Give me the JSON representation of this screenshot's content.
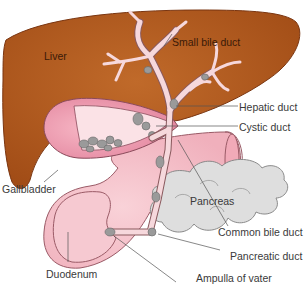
{
  "figure": {
    "colors": {
      "liver": "#b55a1e",
      "liver_edge": "#7a3510",
      "duct": "#f6d8dc",
      "duct_edge": "#8a5a5e",
      "gallbladder": "#f2a6b8",
      "duodenum": "#f5c4cc",
      "pancreas": "#dcdcdc",
      "stone": "#9a9a9a",
      "leader": "#555555"
    },
    "labels": {
      "liver": "Liver",
      "small_bile_duct": "Small bile duct",
      "hepatic_duct": "Hepatic duct",
      "cystic_duct": "Cystic duct",
      "gallbladder": "Gallbladder",
      "pancreas": "Pancreas",
      "common_bile_duct": "Common bile duct",
      "pancreatic_duct": "Pancreatic duct",
      "duodenum": "Duodenum",
      "ampulla_of_vater": "Ampulla of vater"
    }
  }
}
